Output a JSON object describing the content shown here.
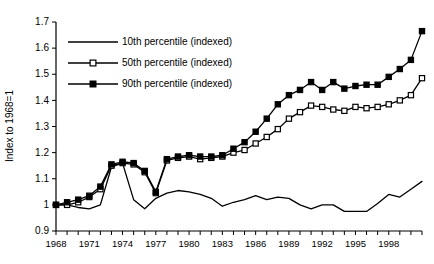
{
  "chart_data": {
    "type": "line",
    "title": "",
    "subtitle": "",
    "xlabel": "",
    "ylabel": "Index to 1968=1",
    "xlim": [
      1968,
      2001
    ],
    "ylim": [
      0.9,
      1.7
    ],
    "grid": false,
    "legend_position": "top-left-inside",
    "y_ticks": [
      "0.9",
      "1",
      "1.1",
      "1.2",
      "1.3",
      "1.4",
      "1.5",
      "1.6",
      "1.7"
    ],
    "y_tick_values": [
      0.9,
      1.0,
      1.1,
      1.2,
      1.3,
      1.4,
      1.5,
      1.6,
      1.7
    ],
    "x_ticks": [
      "1968",
      "1971",
      "1974",
      "1977",
      "1980",
      "1983",
      "1986",
      "1989",
      "1992",
      "1995",
      "1998"
    ],
    "x_tick_values": [
      1968,
      1971,
      1974,
      1977,
      1980,
      1983,
      1986,
      1989,
      1992,
      1995,
      1998
    ],
    "x": [
      1968,
      1969,
      1970,
      1971,
      1972,
      1973,
      1974,
      1975,
      1976,
      1977,
      1978,
      1979,
      1980,
      1981,
      1982,
      1983,
      1984,
      1985,
      1986,
      1987,
      1988,
      1989,
      1990,
      1991,
      1992,
      1993,
      1994,
      1995,
      1996,
      1997,
      1998,
      1999,
      2000,
      2001
    ],
    "series": [
      {
        "name": "10th percentile (indexed)",
        "marker": "none",
        "values": [
          1.0,
          1.0,
          0.99,
          0.985,
          1.0,
          1.145,
          1.16,
          1.02,
          0.985,
          1.025,
          1.045,
          1.055,
          1.05,
          1.04,
          1.025,
          0.995,
          1.01,
          1.02,
          1.035,
          1.02,
          1.03,
          1.025,
          1.0,
          0.985,
          1.0,
          1.0,
          0.975,
          0.975,
          0.975,
          1.005,
          1.04,
          1.03,
          1.06,
          1.09
        ]
      },
      {
        "name": "50th percentile (indexed)",
        "marker": "open-square",
        "values": [
          1.0,
          1.0,
          1.01,
          1.03,
          1.06,
          1.15,
          1.16,
          1.155,
          1.125,
          1.045,
          1.17,
          1.18,
          1.185,
          1.175,
          1.18,
          1.185,
          1.2,
          1.21,
          1.235,
          1.26,
          1.29,
          1.33,
          1.355,
          1.38,
          1.375,
          1.365,
          1.36,
          1.375,
          1.37,
          1.375,
          1.385,
          1.4,
          1.42,
          1.485
        ]
      },
      {
        "name": "90th percentile (indexed)",
        "marker": "filled-square",
        "values": [
          1.0,
          1.01,
          1.02,
          1.035,
          1.07,
          1.155,
          1.165,
          1.16,
          1.13,
          1.05,
          1.175,
          1.185,
          1.19,
          1.185,
          1.185,
          1.19,
          1.215,
          1.24,
          1.28,
          1.33,
          1.385,
          1.42,
          1.44,
          1.47,
          1.44,
          1.47,
          1.445,
          1.455,
          1.46,
          1.46,
          1.49,
          1.52,
          1.555,
          1.665
        ]
      }
    ],
    "colors": {
      "line": "#000000",
      "axis": "#000000",
      "background": "#ffffff",
      "marker_fill_open": "#ffffff",
      "marker_fill_solid": "#000000"
    }
  }
}
